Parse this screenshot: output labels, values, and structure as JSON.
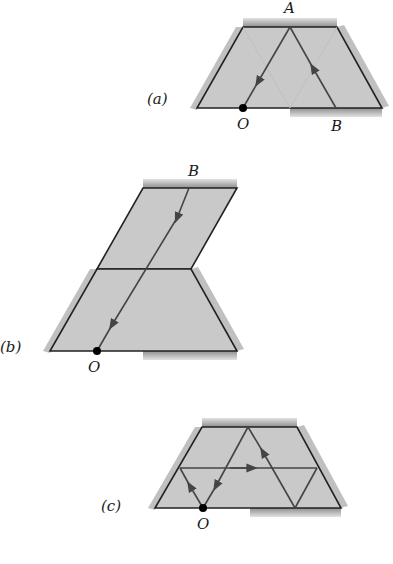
{
  "figures": {
    "a": {
      "label": "(a)",
      "point_top": "A",
      "point_origin": "O",
      "point_bottom": "B"
    },
    "b": {
      "label": "(b)",
      "point_top": "B",
      "point_origin": "O"
    },
    "c": {
      "label": "(c)",
      "point_origin": "O"
    }
  },
  "colors": {
    "fill": "#c9c9c9",
    "edge": "#222222",
    "ray": "#444444",
    "mirror": "#9a9a9a",
    "background": "#ffffff"
  }
}
